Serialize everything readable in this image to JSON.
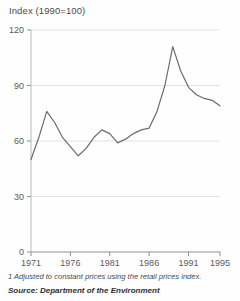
{
  "chart": {
    "title": "Index (1990=100)",
    "footnote": "1 Adjusted to constant prices using the retail prices index.",
    "source": "Source: Department of the Environment"
  },
  "chart_data": {
    "type": "line",
    "title": "Index (1990=100)",
    "xlabel": "",
    "ylabel": "Index (1990=100)",
    "xlim": [
      1971,
      1995
    ],
    "ylim": [
      0,
      120
    ],
    "yticks": [
      0,
      30,
      60,
      90,
      120
    ],
    "xticks": [
      1971,
      1976,
      1981,
      1986,
      1991,
      1995
    ],
    "grid": true,
    "legend": null,
    "line_color": "#6b6b6b",
    "x": [
      1971,
      1972,
      1973,
      1974,
      1975,
      1976,
      1977,
      1978,
      1979,
      1980,
      1981,
      1982,
      1983,
      1984,
      1985,
      1986,
      1987,
      1988,
      1989,
      1990,
      1991,
      1992,
      1993,
      1994,
      1995
    ],
    "values": [
      50,
      62,
      76,
      70,
      62,
      57,
      52,
      56,
      62,
      66,
      64,
      59,
      61,
      64,
      66,
      67,
      76,
      90,
      111,
      98,
      89,
      85,
      83,
      82,
      79
    ],
    "series": [
      {
        "name": "Index (1990=100)",
        "values": [
          50,
          62,
          76,
          70,
          62,
          57,
          52,
          56,
          62,
          66,
          64,
          59,
          61,
          64,
          66,
          67,
          76,
          90,
          111,
          98,
          89,
          85,
          83,
          82,
          79
        ]
      }
    ]
  }
}
